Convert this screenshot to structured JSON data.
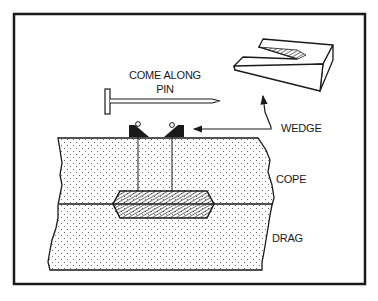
{
  "figure": {
    "type": "technical-illustration",
    "labels": {
      "come_along_line1": "COME ALONG",
      "come_along_line2": "PIN",
      "wedge": "WEDGE",
      "cope": "COPE",
      "drag": "DRAG"
    },
    "colors": {
      "ink": "#1a1a1a",
      "background": "#ffffff",
      "sand_dot": "#555555"
    }
  }
}
